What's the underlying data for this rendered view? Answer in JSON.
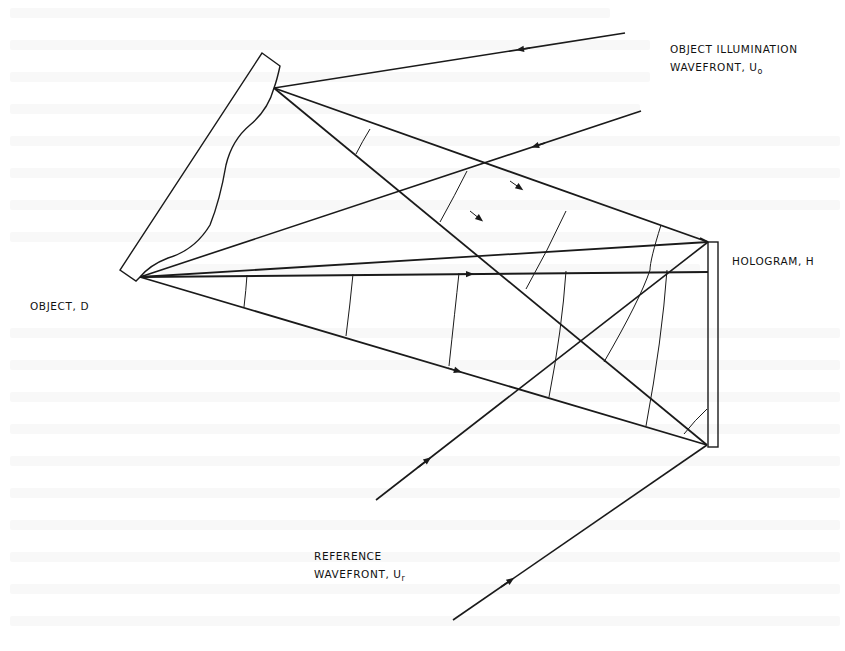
{
  "figure": {
    "labels": {
      "illumination_line1": "OBJECT ILLUMINATION",
      "illumination_line2": "WAVEFRONT, U",
      "illumination_sub": "o",
      "hologram": "HOLOGRAM, H",
      "object": "OBJECT, D",
      "reference_line1": "REFERENCE",
      "reference_line2": "WAVEFRONT, U",
      "reference_sub": "r"
    },
    "colors": {
      "ink": "#1a1a1a",
      "background": "#ffffff",
      "bleed": "#ececec"
    },
    "geometry": {
      "object_point_top": [
        274,
        88
      ],
      "object_point_bottom": [
        140,
        277
      ],
      "hologram_top": [
        708,
        242
      ],
      "hologram_bottom": [
        707,
        445
      ]
    }
  }
}
